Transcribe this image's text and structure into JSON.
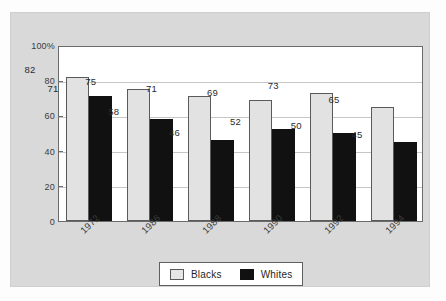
{
  "chart_data": {
    "type": "bar",
    "title": "",
    "xlabel": "",
    "ylabel": "",
    "categories": [
      "1972",
      "1986",
      "1988",
      "1990",
      "1992",
      "1994"
    ],
    "series": [
      {
        "name": "Blacks",
        "values": [
          82,
          75,
          71,
          69,
          73,
          65
        ],
        "color": "#e2e2e2"
      },
      {
        "name": "Whites",
        "values": [
          71,
          58,
          46,
          52,
          50,
          45
        ],
        "color": "#111111"
      }
    ],
    "ylim": [
      0,
      100
    ],
    "yticks": [
      "0",
      "20",
      "40",
      "60",
      "80",
      "100%"
    ],
    "ytick_values": [
      0,
      20,
      40,
      60,
      80,
      100
    ],
    "grid": true,
    "legend_position": "bottom-center",
    "value_labels": true
  },
  "legend": {
    "items": [
      {
        "label": "Blacks",
        "swatch": "light-square-swatch"
      },
      {
        "label": "Whites",
        "swatch": "black-square-swatch"
      }
    ]
  },
  "colors": {
    "panel_background": "#d9d9d9",
    "plot_background": "#ffffff",
    "axis": "#6b6b6b",
    "gridline": "#c6c6c6",
    "blacks_bar": "#e2e2e2",
    "whites_bar": "#111111"
  }
}
